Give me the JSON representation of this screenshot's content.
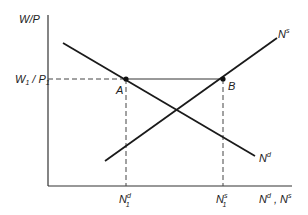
{
  "diagram": {
    "type": "labor-market-supply-demand",
    "y_axis_label": "W/P",
    "x_axis_label": "Nᵈ , Nˢ",
    "wage_level_label": "W₁ / P₁",
    "curves": [
      {
        "name": "labor-demand",
        "label_base": "N",
        "label_sup": "d",
        "slope": "downward"
      },
      {
        "name": "labor-supply",
        "label_base": "N",
        "label_sup": "s",
        "slope": "upward"
      }
    ],
    "points": [
      {
        "label": "A",
        "curve": "labor-demand"
      },
      {
        "label": "B",
        "curve": "labor-supply"
      }
    ],
    "x_ticks": [
      {
        "base": "N",
        "sup": "d",
        "sub": "1"
      },
      {
        "base": "N",
        "sup": "s",
        "sub": "1"
      }
    ],
    "x_axis_title": {
      "d_base": "N",
      "d_sup": "d",
      "sep": " , ",
      "s_base": "N",
      "s_sup": "s"
    },
    "wage": {
      "base_w": "W",
      "sub_w": "1",
      "slash": " / ",
      "base_p": "P",
      "sub_p": "1"
    },
    "colors": {
      "line": "#1a1a1a",
      "dash": "#444444"
    }
  }
}
